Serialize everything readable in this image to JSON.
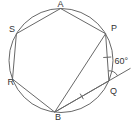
{
  "figure": {
    "type": "circle-inscribed-hexagon-diagram",
    "colors": {
      "background": "#ffffff",
      "line": "#686868",
      "text": "#333333"
    },
    "vertices": {
      "a": "A",
      "p": "P",
      "q": "Q",
      "b": "B",
      "r": "R",
      "s": "S"
    },
    "angle": {
      "label": "60°"
    }
  }
}
